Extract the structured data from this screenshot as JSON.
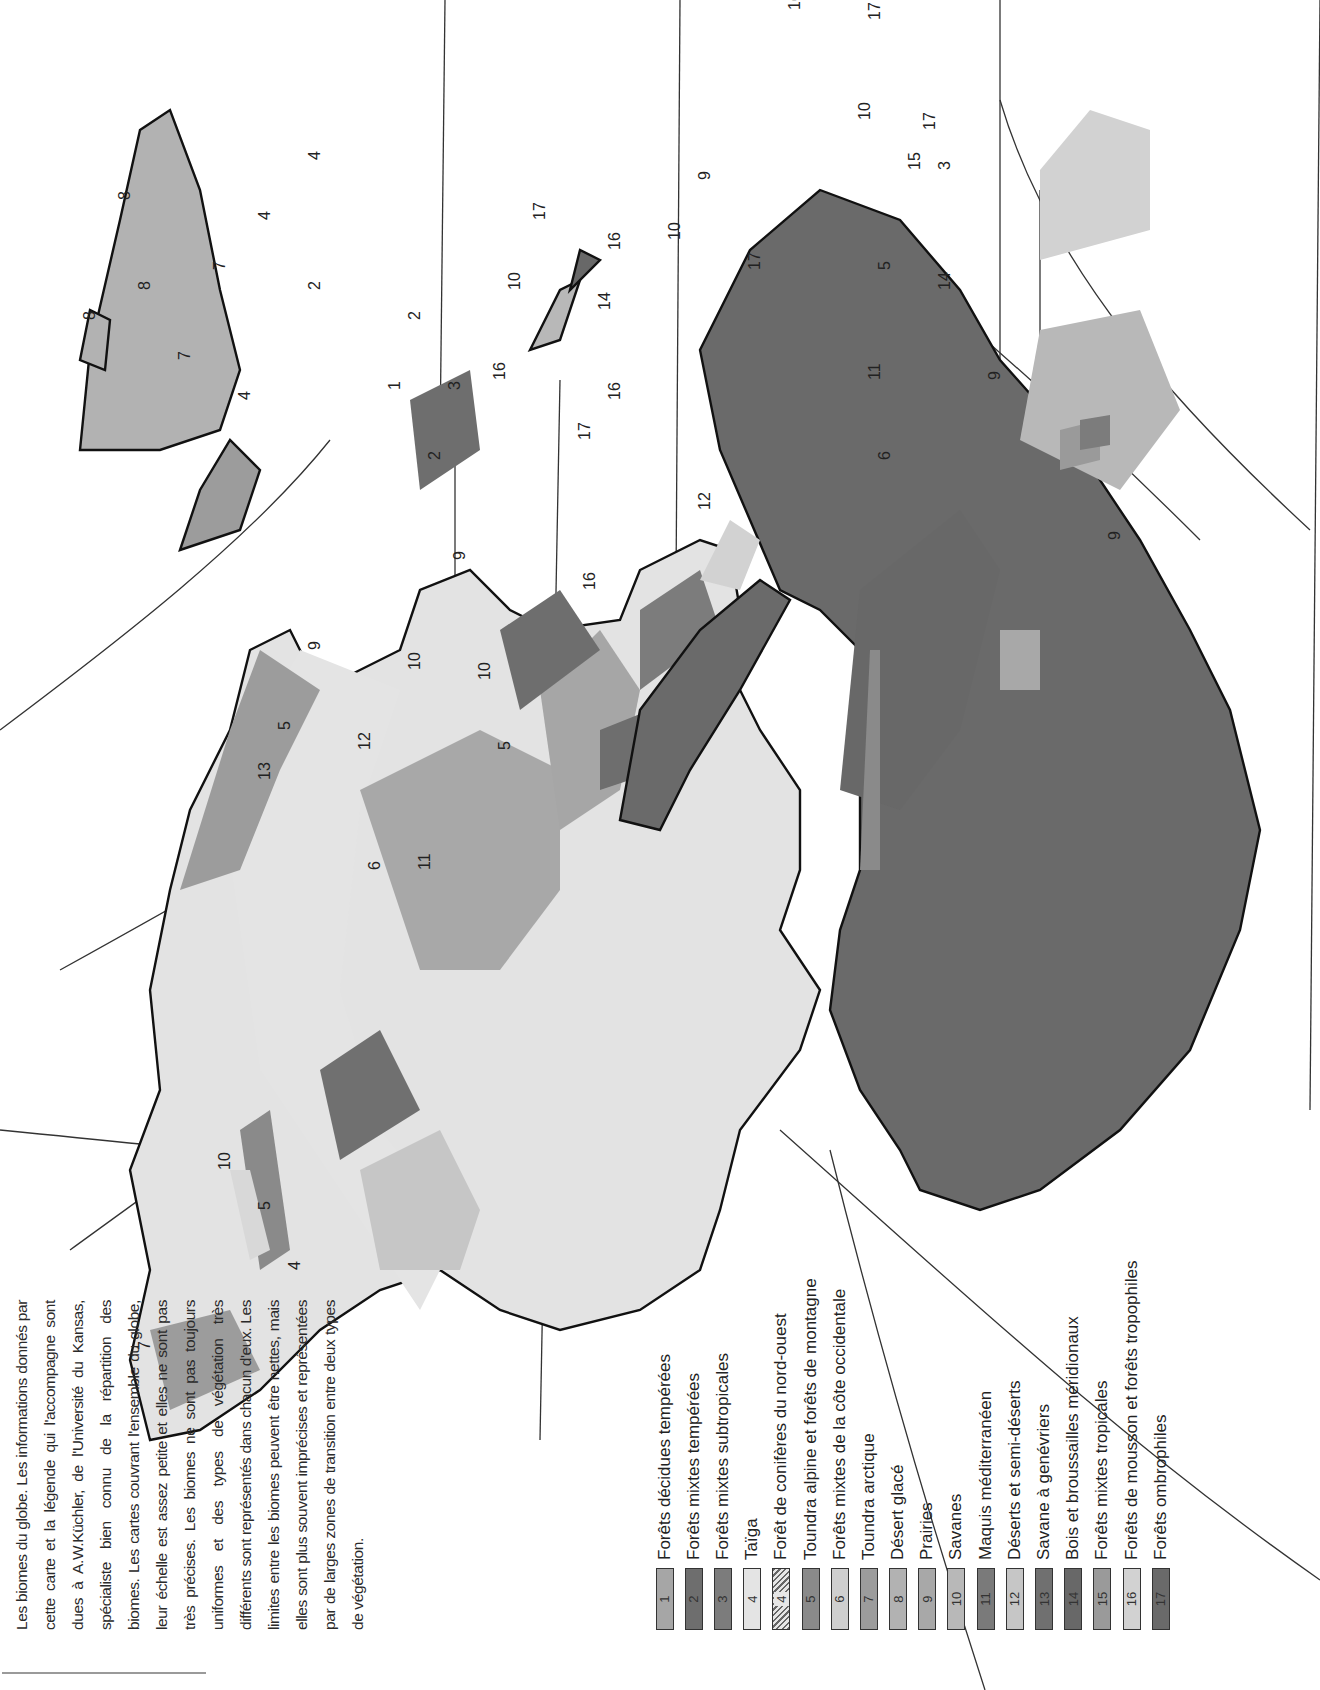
{
  "page": {
    "orientation": "rotated -90deg (landscape content on portrait page)",
    "background": "#ffffff"
  },
  "intro": {
    "text": "Les biomes du globe. Les informations donnés par cette carte et la légende qui l'accompagne sont dues à A.W.Küchler, de l'Université du Kansas, spécialiste bien connu de la répartition des biomes. Les cartes couvrant l'ensemble du globe, leur échelle est assez petite et elles ne sont pas très précises. Les biomes ne sont pas toujours uniformes et des types de végétation très différents sont représentés dans chacun d'eux. Les limites entre les biomes peuvent être nettes, mais elles sont plus souvent imprécises et représentées par de larges zones de transition entre deux types de végétation."
  },
  "legend": {
    "items": [
      {
        "code": "1",
        "label": "Forêts décidues tempérées",
        "color": "#a6a6a6",
        "hatched": false
      },
      {
        "code": "2",
        "label": "Forêts mixtes tempérées",
        "color": "#6e6e6e",
        "hatched": false
      },
      {
        "code": "3",
        "label": "Forêts mixtes subtropicales",
        "color": "#7c7c7c",
        "hatched": false
      },
      {
        "code": "4",
        "label": "Taïga",
        "color": "#e4e4e4",
        "hatched": false
      },
      {
        "code": "4",
        "label": "Forêt de conifères du nord-ouest",
        "color": "#e6e6e6",
        "hatched": true
      },
      {
        "code": "5",
        "label": "Toundra alpine et forêts de montagne",
        "color": "#8a8a8a",
        "hatched": false
      },
      {
        "code": "6",
        "label": "Forêts mixtes de la côte occidentale",
        "color": "#cfcfcf",
        "hatched": false
      },
      {
        "code": "7",
        "label": "Toundra arctique",
        "color": "#9c9c9c",
        "hatched": false
      },
      {
        "code": "8",
        "label": "Désert glacé",
        "color": "#b2b2b2",
        "hatched": false
      },
      {
        "code": "9",
        "label": "Prairies",
        "color": "#a8a8a8",
        "hatched": false
      },
      {
        "code": "10",
        "label": "Savanes",
        "color": "#b8b8b8",
        "hatched": false
      },
      {
        "code": "11",
        "label": "Maquis méditerranéen",
        "color": "#7a7a7a",
        "hatched": false
      },
      {
        "code": "12",
        "label": "Déserts et semi-déserts",
        "color": "#c6c6c6",
        "hatched": false
      },
      {
        "code": "13",
        "label": "Savane à genévriers",
        "color": "#707070",
        "hatched": false
      },
      {
        "code": "14",
        "label": "Bois et broussailles méridionaux",
        "color": "#686868",
        "hatched": false
      },
      {
        "code": "15",
        "label": "Forêts mixtes tropicales",
        "color": "#9a9a9a",
        "hatched": false
      },
      {
        "code": "16",
        "label": "Forêts de mousson et forêts tropophiles",
        "color": "#d2d2d2",
        "hatched": false
      },
      {
        "code": "17",
        "label": "Forêts ombrophiles",
        "color": "#6a6a6a",
        "hatched": false
      }
    ]
  },
  "map": {
    "title": "Biomes of the Americas (numbered regions)",
    "labels": [
      {
        "n": "8",
        "region": "Greenland"
      },
      {
        "n": "8",
        "region": "Ellesmere"
      },
      {
        "n": "8",
        "region": "Baffin"
      },
      {
        "n": "7",
        "region": "Arctic islands"
      },
      {
        "n": "7",
        "region": "Northern Canada"
      },
      {
        "n": "7",
        "region": "Alaska"
      },
      {
        "n": "4",
        "region": "Labrador"
      },
      {
        "n": "4",
        "region": "Canadian taiga"
      },
      {
        "n": "4",
        "region": "Newfoundland"
      },
      {
        "n": "4",
        "region": "Northwest coast (hatched)"
      },
      {
        "n": "10",
        "region": "Canadian prairie edge"
      },
      {
        "n": "5",
        "region": "Rocky Mountains"
      },
      {
        "n": "2",
        "region": "Great Lakes"
      },
      {
        "n": "2",
        "region": "Appalachians"
      },
      {
        "n": "2",
        "region": "Northeast"
      },
      {
        "n": "1",
        "region": "Eastern US"
      },
      {
        "n": "3",
        "region": "Southeast US"
      },
      {
        "n": "9",
        "region": "Great Plains"
      },
      {
        "n": "9",
        "region": "Texas coast"
      },
      {
        "n": "13",
        "region": "Great Basin"
      },
      {
        "n": "5",
        "region": "Colorado Plateau"
      },
      {
        "n": "12",
        "region": "Southwest deserts"
      },
      {
        "n": "10",
        "region": "Mexico"
      },
      {
        "n": "10",
        "region": "Mexico east"
      },
      {
        "n": "5",
        "region": "Sierra Madre"
      },
      {
        "n": "6",
        "region": "California coast"
      },
      {
        "n": "11",
        "region": "California"
      },
      {
        "n": "16",
        "region": "Yucatán"
      },
      {
        "n": "17",
        "region": "Central America"
      },
      {
        "n": "16",
        "region": "Central America Pacific"
      },
      {
        "n": "10",
        "region": "Cuba"
      },
      {
        "n": "14",
        "region": "Caribbean"
      },
      {
        "n": "17",
        "region": "Caribbean islands"
      },
      {
        "n": "16",
        "region": "Venezuela"
      },
      {
        "n": "10",
        "region": "Llanos"
      },
      {
        "n": "9",
        "region": "Amazon enclave"
      },
      {
        "n": "17",
        "region": "Amazon"
      },
      {
        "n": "16",
        "region": "Ecuador"
      },
      {
        "n": "12",
        "region": "Peru-Chile coast"
      },
      {
        "n": "16",
        "region": "Northeast Brazil"
      },
      {
        "n": "17",
        "region": "Atlantic coast north"
      },
      {
        "n": "10",
        "region": "Brazilian cerrado"
      },
      {
        "n": "17",
        "region": "Atlantic coast south"
      },
      {
        "n": "15",
        "region": "Southeast Brazil"
      },
      {
        "n": "3",
        "region": "Southern Brazil"
      },
      {
        "n": "14",
        "region": "Gran Chaco / Argentina"
      },
      {
        "n": "5",
        "region": "Andes"
      },
      {
        "n": "9",
        "region": "Pampas"
      },
      {
        "n": "11",
        "region": "Central Chile"
      },
      {
        "n": "6",
        "region": "Southern Chile"
      },
      {
        "n": "9",
        "region": "Falklands"
      }
    ]
  }
}
